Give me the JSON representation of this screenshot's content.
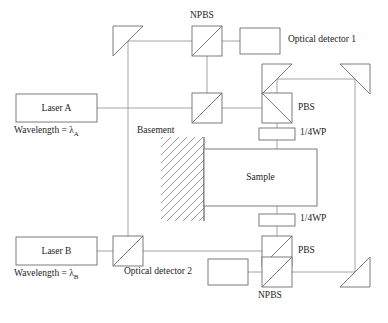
{
  "figure": {
    "type": "optical-interferometer-schematic",
    "background": "#ffffff",
    "beam_color": "#9a9a9a",
    "component_color": "#6e6e6e",
    "text_color": "#1d1d1d"
  },
  "labels": {
    "npbs_top": "NPBS",
    "npbs_bottom": "NPBS",
    "pbs_top": "PBS",
    "pbs_bottom": "PBS",
    "qwp_top": "1/4WP",
    "qwp_bottom": "1/4WP",
    "detector_1": "Optical detector 1",
    "detector_2": "Optical detector 2",
    "laser_a": "Laser A",
    "laser_b": "Laser B",
    "wavelength_a_prefix": "Wavelength = ",
    "wavelength_a_symbol": "λ",
    "wavelength_a_sub": "A",
    "wavelength_b_prefix": "Wavelength = ",
    "wavelength_b_symbol": "λ",
    "wavelength_b_sub": "B",
    "basement": "Basement",
    "sample": "Sample"
  },
  "components": {
    "mirrors": [
      {
        "name": "mirror-top-left",
        "orientation": "top-left-top-right-bottom-left"
      },
      {
        "name": "mirror-right-upper-left",
        "orientation": "top-left-top-right-bottom-left"
      },
      {
        "name": "mirror-right-upper-right",
        "orientation": "top-left-top-right-bottom-right"
      },
      {
        "name": "mirror-bottom-right",
        "orientation": "top-right-bottom-left-bottom-right"
      }
    ],
    "beam_splitters": [
      {
        "name": "npbs-top",
        "diagonal": "bottom-left-to-top-right"
      },
      {
        "name": "npbs-mid-left",
        "diagonal": "bottom-left-to-top-right"
      },
      {
        "name": "npbs-laser-b",
        "diagonal": "bottom-left-to-top-right"
      },
      {
        "name": "npbs-bottom",
        "diagonal": "bottom-left-to-top-right"
      },
      {
        "name": "pbs-top",
        "diagonal": "top-left-to-bottom-right"
      },
      {
        "name": "pbs-bottom",
        "diagonal": "bottom-left-to-top-right"
      }
    ],
    "waveplates": [
      "qwp-top",
      "qwp-bottom"
    ],
    "detectors": [
      "detector-1-box",
      "detector-2-box"
    ],
    "lasers": [
      "laser-a-box",
      "laser-b-box"
    ],
    "sample": "sample-box",
    "basement": "basement-hatched-region"
  }
}
